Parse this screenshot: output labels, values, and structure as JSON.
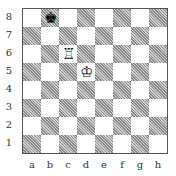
{
  "diagram": {
    "ranks": [
      "8",
      "7",
      "6",
      "5",
      "4",
      "3",
      "2",
      "1"
    ],
    "files": [
      "a",
      "b",
      "c",
      "d",
      "e",
      "f",
      "g",
      "h"
    ],
    "pieces": [
      {
        "square": "b8",
        "piece": "black-king",
        "glyph": "♚"
      },
      {
        "square": "c6",
        "piece": "white-rook",
        "glyph": "♖"
      },
      {
        "square": "d5",
        "piece": "white-king",
        "glyph": "♔"
      }
    ]
  }
}
